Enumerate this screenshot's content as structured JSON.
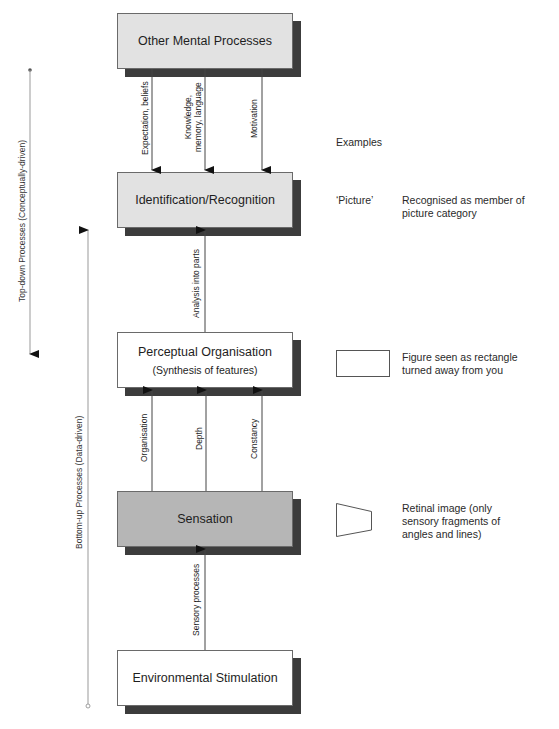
{
  "boxes": [
    {
      "id": "other-mental-processes",
      "label": "Other Mental Processes",
      "fill": "#e2e2e2"
    },
    {
      "id": "identification-recognition",
      "label": "Identification/Recognition",
      "fill": "#e2e2e2"
    },
    {
      "id": "perceptual-organisation",
      "label": "Perceptual Organisation",
      "sublabel": "(Synthesis of features)",
      "fill": "#ffffff"
    },
    {
      "id": "sensation",
      "label": "Sensation",
      "fill": "#b6b6b6"
    },
    {
      "id": "environmental-stimulation",
      "label": "Environmental Stimulation",
      "fill": "#ffffff"
    }
  ],
  "arrows": {
    "top_down": [
      {
        "label": "Expectation, beliefs",
        "from": "other-mental-processes",
        "to": "identification-recognition"
      },
      {
        "label_line1": "Knowledge,",
        "label_line2": "memory, language",
        "from": "other-mental-processes",
        "to": "identification-recognition"
      },
      {
        "label": "Motivation",
        "from": "other-mental-processes",
        "to": "identification-recognition"
      }
    ],
    "analysis": {
      "label": "Analysis into parts",
      "from": "perceptual-organisation",
      "to": "identification-recognition"
    },
    "bottom_up": [
      {
        "label": "Organisation",
        "from": "sensation",
        "to": "perceptual-organisation"
      },
      {
        "label": "Depth",
        "from": "sensation",
        "to": "perceptual-organisation"
      },
      {
        "label": "Constancy",
        "from": "sensation",
        "to": "perceptual-organisation"
      }
    ],
    "sensory": {
      "label": "Sensory processes",
      "from": "environmental-stimulation",
      "to": "sensation"
    }
  },
  "side_axes": {
    "top_down": "Top-down Processes (Conceptually-driven)",
    "bottom_up": "Bottom-up Processes (Data-driven)"
  },
  "examples": {
    "heading": "Examples",
    "recognition_term": "‘Picture’",
    "recognition_line1": "Recognised as member of",
    "recognition_line2": "picture category",
    "perceptual_line1": "Figure seen as rectangle",
    "perceptual_line2": "turned away from you",
    "retinal_line1": "Retinal image (only",
    "retinal_line2": "sensory fragments of",
    "retinal_line3": "angles and lines)"
  }
}
